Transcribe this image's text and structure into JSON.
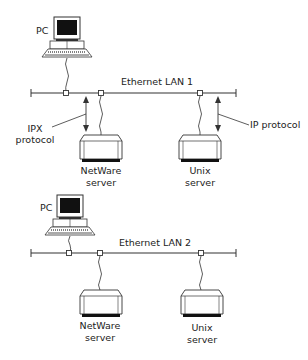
{
  "diagram": {
    "networks": [
      {
        "label": "Ethernet LAN 1",
        "pc_label": "PC",
        "servers": [
          {
            "line1": "NetWare",
            "line2": "server"
          },
          {
            "line1": "Unix",
            "line2": "server"
          }
        ],
        "protocols": [
          {
            "line1": "IPX",
            "line2": "protocol"
          },
          {
            "line1": "IP protocol"
          }
        ]
      },
      {
        "label": "Ethernet LAN 2",
        "pc_label": "PC",
        "servers": [
          {
            "line1": "NetWare",
            "line2": "server"
          },
          {
            "line1": "Unix",
            "line2": "server"
          }
        ]
      }
    ],
    "colors": {
      "line": "#333333",
      "screen": "#111111",
      "background": "#ffffff"
    }
  }
}
